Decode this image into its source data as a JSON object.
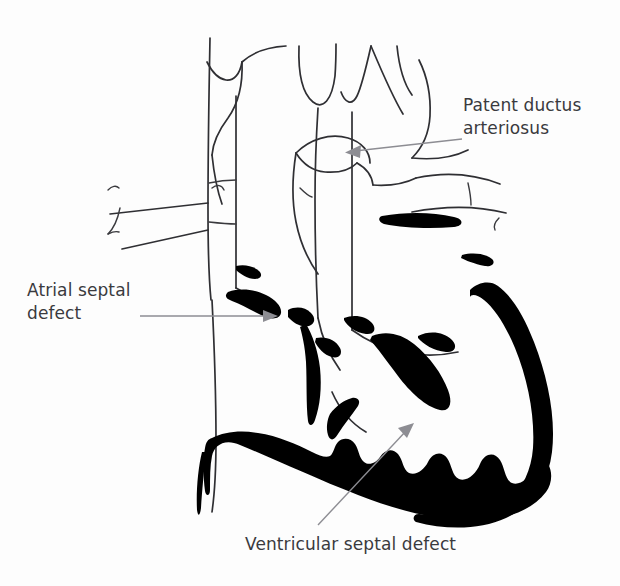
{
  "figure": {
    "background_color": "#fdfdfd",
    "ink_color": "#2f2f33",
    "fill_color": "#000000",
    "leader_color": "#8d8d93",
    "text_color": "#3a3a3e",
    "width": 620,
    "height": 586
  },
  "annotations": [
    {
      "id": "pda",
      "label_line_1": "Patent ductus",
      "label_line_2": "arteriosus",
      "label_full": "Patent ductus arteriosus",
      "label_x": 463,
      "label_y": 94,
      "leader_from_x": 462,
      "leader_from_y": 139,
      "leader_to_x": 348,
      "leader_to_y": 152,
      "arrow_direction": "left"
    },
    {
      "id": "asd",
      "label_line_1": "Atrial septal",
      "label_line_2": "defect",
      "label_full": "Atrial septal defect",
      "label_x": 27,
      "label_y": 279,
      "leader_from_x": 140,
      "leader_from_y": 316,
      "leader_to_x": 276,
      "leader_to_y": 316,
      "arrow_direction": "right"
    },
    {
      "id": "vsd",
      "label_line_1": "Ventricular septal defect",
      "label_line_2": "",
      "label_full": "Ventricular septal defect",
      "label_x": 245,
      "label_y": 533,
      "leader_from_x": 318,
      "leader_from_y": 525,
      "leader_to_x": 413,
      "leader_to_y": 424,
      "arrow_direction": "up-right"
    }
  ],
  "anatomy": {
    "structures": [
      "aortic arch",
      "brachiocephalic artery",
      "left common carotid artery",
      "left subclavian artery",
      "superior vena cava",
      "ascending aorta",
      "pulmonary trunk",
      "right pulmonary artery",
      "left pulmonary artery",
      "ductus arteriosus",
      "atrial septum",
      "ventricular septum",
      "ventricular myocardium",
      "atrioventricular valve leaflets"
    ]
  }
}
